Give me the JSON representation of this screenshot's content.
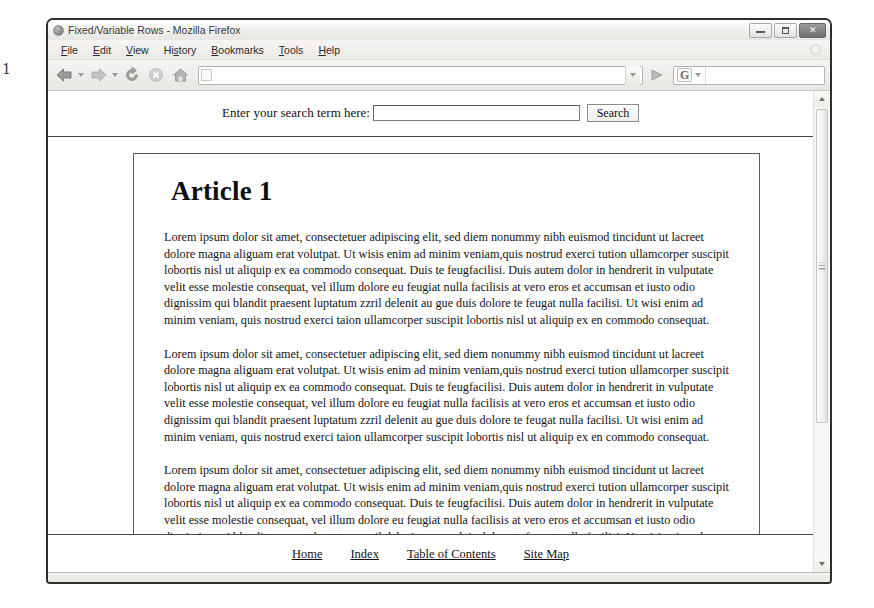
{
  "artifact": {
    "glyph": "1"
  },
  "window": {
    "title": "Fixed/Variable Rows - Mozilla Firefox",
    "icon": "firefox-icon",
    "controls": {
      "minimize_label": "Minimize",
      "maximize_label": "Maximize",
      "close_label": "Close",
      "close_glyph": "✕"
    }
  },
  "menubar": {
    "items": [
      {
        "label": "File",
        "accel": "F"
      },
      {
        "label": "Edit",
        "accel": "E"
      },
      {
        "label": "View",
        "accel": "V"
      },
      {
        "label": "History",
        "accel": "H"
      },
      {
        "label": "Bookmarks",
        "accel": "B"
      },
      {
        "label": "Tools",
        "accel": "T"
      },
      {
        "label": "Help",
        "accel": "H"
      }
    ]
  },
  "toolbar": {
    "back_icon": "back-arrow-icon",
    "back_dropdown_icon": "chevron-down-icon",
    "forward_icon": "forward-arrow-icon",
    "forward_dropdown_icon": "chevron-down-icon",
    "reload_icon": "reload-icon",
    "stop_icon": "stop-icon",
    "home_icon": "home-icon",
    "address_value": "",
    "address_placeholder": "",
    "address_dropdown_icon": "chevron-down-icon",
    "go_icon": "go-arrow-icon",
    "search_engine_glyph": "G",
    "search_engine_dropdown_icon": "chevron-down-icon",
    "search_value": "",
    "search_placeholder": "",
    "search_magnifier_icon": "magnifier-icon"
  },
  "page": {
    "search": {
      "label": "Enter your search term here:",
      "input_value": "",
      "input_placeholder": "",
      "button_label": "Search"
    },
    "article": {
      "heading": "Article 1",
      "paragraphs": [
        "Lorem ipsum dolor sit amet, consectetuer adipiscing elit, sed diem nonummy nibh euismod tincidunt ut lacreet dolore magna aliguam erat volutpat. Ut wisis enim ad minim veniam,quis nostrud exerci tution ullamcorper suscipit lobortis nisl ut aliquip ex ea commodo consequat. Duis te feugfacilisi. Duis autem dolor in hendrerit in vulputate velit esse molestie consequat, vel illum dolore eu feugiat nulla facilisis at vero eros et accumsan et iusto odio dignissim qui blandit praesent luptatum zzril delenit au gue duis dolore te feugat nulla facilisi. Ut wisi enim ad minim veniam, quis nostrud exerci taion ullamcorper suscipit lobortis nisl ut aliquip ex en commodo consequat.",
        "Lorem ipsum dolor sit amet, consectetuer adipiscing elit, sed diem nonummy nibh euismod tincidunt ut lacreet dolore magna aliguam erat volutpat. Ut wisis enim ad minim veniam,quis nostrud exerci tution ullamcorper suscipit lobortis nisl ut aliquip ex ea commodo consequat. Duis te feugfacilisi. Duis autem dolor in hendrerit in vulputate velit esse molestie consequat, vel illum dolore eu feugiat nulla facilisis at vero eros et accumsan et iusto odio dignissim qui blandit praesent luptatum zzril delenit au gue duis dolore te feugat nulla facilisi. Ut wisi enim ad minim veniam, quis nostrud exerci taion ullamcorper suscipit lobortis nisl ut aliquip ex en commodo consequat.",
        "Lorem ipsum dolor sit amet, consectetuer adipiscing elit, sed diem nonummy nibh euismod tincidunt ut lacreet dolore magna aliguam erat volutpat. Ut wisis enim ad minim veniam,quis nostrud exerci tution ullamcorper suscipit lobortis nisl ut aliquip ex ea commodo consequat. Duis te feugfacilisi. Duis autem dolor in hendrerit in vulputate velit esse molestie consequat, vel illum dolore eu feugiat nulla facilisis at vero eros et accumsan et iusto odio dignissim qui blandit praesent luptatum zzril delenit au gue duis dolore te feugat nulla facilisi. Ut wisi enim ad minim veniam, quis nostrud exerci taion ullamcorper suscipit lobortis nisl ut aliquip ex en commodo consequat."
      ]
    },
    "footer": {
      "links": [
        {
          "label": "Home"
        },
        {
          "label": "Index"
        },
        {
          "label": "Table of Contents"
        },
        {
          "label": "Site Map"
        }
      ]
    }
  },
  "scrollbar": {
    "up_icon": "scroll-up-arrow-icon",
    "down_icon": "scroll-down-arrow-icon",
    "thumb_name": "scroll-thumb"
  },
  "colors": {
    "window_frame": "#2e2e2e",
    "chrome_bg": "#eceae7",
    "page_bg": "#ffffff",
    "text": "#131313",
    "rule": "#4a4a4a"
  }
}
